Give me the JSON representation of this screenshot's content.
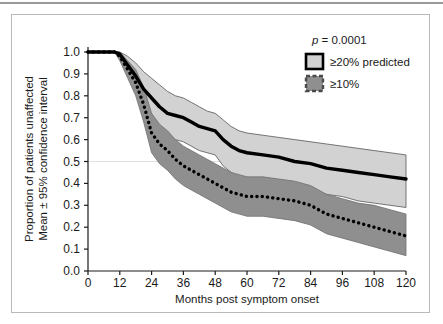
{
  "figure": {
    "frame_color": "#b9b9b9",
    "background": "#ffffff"
  },
  "axes": {
    "x_title": "Months post symptom onset",
    "y_title_line1": "Proportion of patients unaffected",
    "y_title_line2": "Mean ± 95% confidence interval",
    "x_ticks": [
      "0",
      "12",
      "24",
      "36",
      "48",
      "60",
      "72",
      "84",
      "96",
      "108",
      "120"
    ],
    "y_ticks": [
      "0.0",
      "0.1",
      "0.2",
      "0.3",
      "0.4",
      "0.5",
      "0.6",
      "0.7",
      "0.8",
      "0.9",
      "1.0"
    ]
  },
  "legend": {
    "pvalue_italic": "p",
    "pvalue_text": " = 0.0001",
    "items": [
      {
        "label": "≥20% predicted",
        "fill": "#d2d2d2",
        "border": "#000000",
        "border_style": "solid"
      },
      {
        "label": "≥10%",
        "fill": "#8f8f8f",
        "border": "#4a4a4a",
        "border_style": "dashed"
      }
    ]
  },
  "chart_data": {
    "type": "line",
    "title": "",
    "xlabel": "Months post symptom onset",
    "ylabel": "Proportion of patients unaffected; Mean ± 95% confidence interval",
    "xlim": [
      0,
      120
    ],
    "ylim": [
      0.0,
      1.0
    ],
    "xticks": [
      0,
      12,
      24,
      36,
      48,
      60,
      72,
      84,
      96,
      108,
      120
    ],
    "yticks": [
      0.0,
      0.1,
      0.2,
      0.3,
      0.4,
      0.5,
      0.6,
      0.7,
      0.8,
      0.9,
      1.0
    ],
    "grid": "horizontal-single-at-0.5",
    "legend_position": "top-right",
    "annotations": [
      "p = 0.0001"
    ],
    "x": [
      0,
      6,
      10,
      12,
      15,
      18,
      21,
      24,
      27,
      30,
      33,
      36,
      39,
      42,
      45,
      48,
      51,
      54,
      57,
      60,
      66,
      72,
      78,
      84,
      90,
      96,
      102,
      108,
      114,
      120
    ],
    "series": [
      {
        "name": "≥20% predicted",
        "style": "solid-thick-black",
        "color": "#000000",
        "band_fill": "#d2d2d2",
        "mean": [
          1.0,
          1.0,
          1.0,
          0.99,
          0.94,
          0.89,
          0.83,
          0.79,
          0.75,
          0.72,
          0.71,
          0.7,
          0.68,
          0.66,
          0.65,
          0.64,
          0.6,
          0.57,
          0.55,
          0.54,
          0.53,
          0.52,
          0.5,
          0.49,
          0.47,
          0.46,
          0.45,
          0.44,
          0.43,
          0.42
        ],
        "upper": [
          1.0,
          1.0,
          1.0,
          1.0,
          0.98,
          0.95,
          0.91,
          0.88,
          0.85,
          0.82,
          0.8,
          0.79,
          0.77,
          0.75,
          0.73,
          0.72,
          0.69,
          0.66,
          0.64,
          0.63,
          0.62,
          0.61,
          0.6,
          0.59,
          0.58,
          0.57,
          0.56,
          0.55,
          0.54,
          0.53
        ],
        "lower": [
          1.0,
          1.0,
          1.0,
          0.98,
          0.9,
          0.83,
          0.76,
          0.7,
          0.65,
          0.62,
          0.6,
          0.59,
          0.57,
          0.55,
          0.54,
          0.53,
          0.48,
          0.45,
          0.43,
          0.42,
          0.41,
          0.4,
          0.38,
          0.37,
          0.35,
          0.34,
          0.32,
          0.31,
          0.3,
          0.29
        ]
      },
      {
        "name": "≥10%",
        "style": "dotted-thick-black",
        "color": "#000000",
        "band_fill": "#8f8f8f",
        "mean": [
          1.0,
          1.0,
          1.0,
          0.98,
          0.92,
          0.86,
          0.76,
          0.63,
          0.58,
          0.55,
          0.51,
          0.48,
          0.46,
          0.44,
          0.42,
          0.4,
          0.38,
          0.36,
          0.35,
          0.34,
          0.34,
          0.33,
          0.32,
          0.3,
          0.26,
          0.24,
          0.22,
          0.2,
          0.18,
          0.16
        ],
        "upper": [
          1.0,
          1.0,
          1.0,
          1.0,
          0.96,
          0.92,
          0.84,
          0.72,
          0.67,
          0.64,
          0.6,
          0.57,
          0.55,
          0.53,
          0.51,
          0.49,
          0.47,
          0.45,
          0.44,
          0.43,
          0.43,
          0.42,
          0.41,
          0.39,
          0.35,
          0.33,
          0.31,
          0.3,
          0.28,
          0.26
        ],
        "lower": [
          1.0,
          1.0,
          1.0,
          0.96,
          0.88,
          0.8,
          0.68,
          0.54,
          0.49,
          0.46,
          0.42,
          0.39,
          0.37,
          0.35,
          0.33,
          0.31,
          0.29,
          0.27,
          0.26,
          0.25,
          0.25,
          0.24,
          0.23,
          0.21,
          0.17,
          0.15,
          0.13,
          0.11,
          0.09,
          0.07
        ]
      }
    ]
  }
}
